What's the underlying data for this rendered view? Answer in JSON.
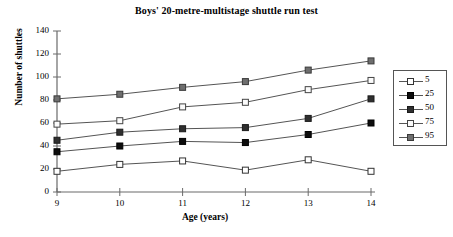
{
  "chart_data": {
    "type": "line",
    "title": "Boys' 20-metre-multistage shuttle run test",
    "xlabel": "Age (years)",
    "ylabel": "Number of shuttles",
    "x": [
      9,
      10,
      11,
      12,
      13,
      14
    ],
    "xtick_labels": [
      "9",
      "10",
      "11",
      "12",
      "13",
      "14"
    ],
    "ytick_labels": [
      "0",
      "20",
      "40",
      "60",
      "80",
      "100",
      "120",
      "140"
    ],
    "yticks": [
      0,
      20,
      40,
      60,
      80,
      100,
      120,
      140
    ],
    "xlim": [
      9,
      14
    ],
    "ylim": [
      0,
      140
    ],
    "grid": false,
    "legend_position": "right-outside",
    "legend_title": "",
    "series": [
      {
        "name": "5",
        "label": "5",
        "marker": "open-square",
        "marker_fill": "#ffffff",
        "marker_edge": "#333333",
        "line_color": "#555555",
        "values": [
          18,
          24,
          27,
          19,
          28,
          18
        ]
      },
      {
        "name": "25",
        "label": "25",
        "marker": "filled-square",
        "marker_fill": "#0d0d0d",
        "marker_edge": "#000000",
        "line_color": "#555555",
        "values": [
          35,
          40,
          44,
          43,
          50,
          60
        ]
      },
      {
        "name": "50",
        "label": "50",
        "marker": "filled-square",
        "marker_fill": "#2f2f2f",
        "marker_edge": "#1a1a1a",
        "line_color": "#555555",
        "values": [
          45,
          52,
          55,
          56,
          64,
          81
        ]
      },
      {
        "name": "75",
        "label": "75",
        "marker": "open-square",
        "marker_fill": "#fbfbfb",
        "marker_edge": "#444444",
        "line_color": "#555555",
        "values": [
          59,
          62,
          74,
          78,
          89,
          97
        ]
      },
      {
        "name": "95",
        "label": "95",
        "marker": "filled-square",
        "marker_fill": "#6e6e6e",
        "marker_edge": "#3a3a3a",
        "line_color": "#555555",
        "values": [
          81,
          85,
          91,
          96,
          106,
          114
        ]
      }
    ]
  }
}
